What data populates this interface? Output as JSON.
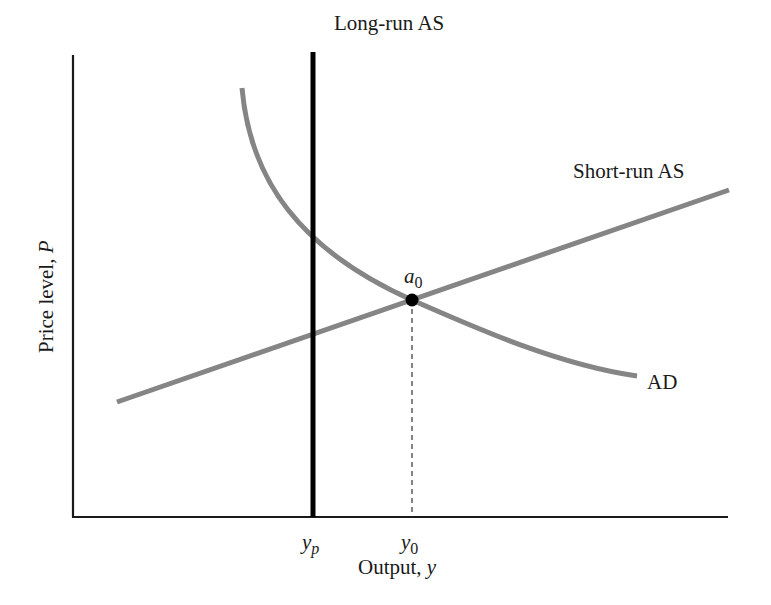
{
  "diagram": {
    "axes": {
      "x_label": "Output, ",
      "x_label_var": "y",
      "y_label": "Price level, ",
      "y_label_var": "P"
    },
    "curves": {
      "long_run_as": {
        "label": "Long-run AS",
        "color": "#000000"
      },
      "short_run_as": {
        "label": "Short-run AS",
        "color": "#808080"
      },
      "ad": {
        "label": "AD",
        "color": "#808080"
      }
    },
    "points": {
      "equilibrium": {
        "label_base": "a",
        "label_sub": "0"
      }
    },
    "ticks": {
      "yp": {
        "base": "y",
        "sub": "p"
      },
      "y0": {
        "base": "y",
        "sub": "0"
      }
    }
  }
}
